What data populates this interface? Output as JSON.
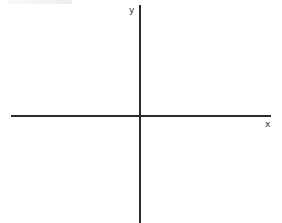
{
  "diagram": {
    "type": "cartesian-axes",
    "axes": {
      "x": {
        "label": "x",
        "color": "#2b2b2b"
      },
      "y": {
        "label": "y",
        "color": "#2b2b2b"
      }
    },
    "origin": {
      "px": 139,
      "py": 115
    },
    "background": "#ffffff"
  }
}
